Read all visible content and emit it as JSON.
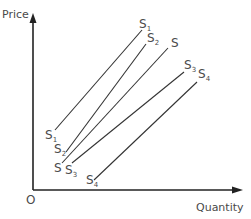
{
  "diagram": {
    "type": "supply-curve-shifts",
    "axes": {
      "y_label": "Price",
      "x_label": "Quantity",
      "origin_label": "O"
    },
    "curves": [
      {
        "id": "S1",
        "letter": "S",
        "subscript": "1",
        "x1": 55,
        "y1": 130,
        "x2": 142,
        "y2": 30
      },
      {
        "id": "S2",
        "letter": "S",
        "subscript": "2",
        "x1": 66,
        "y1": 152,
        "x2": 146,
        "y2": 44
      },
      {
        "id": "S",
        "letter": "S",
        "subscript": "",
        "x1": 62,
        "y1": 163,
        "x2": 168,
        "y2": 48
      },
      {
        "id": "S3",
        "letter": "S",
        "subscript": "3",
        "x1": 72,
        "y1": 163,
        "x2": 184,
        "y2": 72
      },
      {
        "id": "S4",
        "letter": "S",
        "subscript": "4",
        "x1": 94,
        "y1": 180,
        "x2": 197,
        "y2": 82
      }
    ],
    "colors": {
      "axis": "#222222",
      "curve": "#333333",
      "text": "#4a4a4a"
    }
  }
}
